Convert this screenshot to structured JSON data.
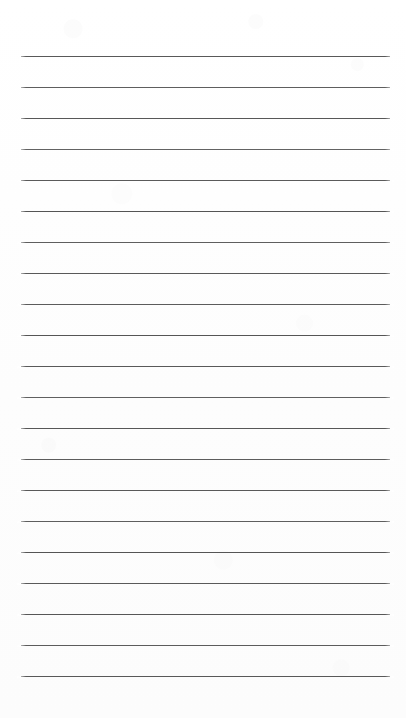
{
  "document": {
    "kind": "scanned-lined-notepad-page",
    "page_width": 406,
    "page_height": 718,
    "paper_color": "#fdfdfd",
    "text_content": "",
    "has_handwriting": false,
    "has_margin_rule": false,
    "has_page_border": false
  },
  "ruling": {
    "line_color": "#4d4d4d",
    "line_thickness_px": 1.2,
    "line_count": 21,
    "line_left_x": 21,
    "line_right_x": 390,
    "line_length_px": 369,
    "line_spacing_px": 31,
    "first_line_y": 56,
    "last_line_y": 676,
    "top_margin_px": 56,
    "bottom_margin_px": 42,
    "lines": [
      {
        "index": 1,
        "y": 56,
        "opacity": 0.93
      },
      {
        "index": 2,
        "y": 87,
        "opacity": 0.9
      },
      {
        "index": 3,
        "y": 118,
        "opacity": 0.94
      },
      {
        "index": 4,
        "y": 149,
        "opacity": 0.88
      },
      {
        "index": 5,
        "y": 180,
        "opacity": 0.92
      },
      {
        "index": 6,
        "y": 211,
        "opacity": 0.95
      },
      {
        "index": 7,
        "y": 242,
        "opacity": 0.9
      },
      {
        "index": 8,
        "y": 273,
        "opacity": 0.93
      },
      {
        "index": 9,
        "y": 304,
        "opacity": 0.91
      },
      {
        "index": 10,
        "y": 335,
        "opacity": 0.95
      },
      {
        "index": 11,
        "y": 366,
        "opacity": 0.92
      },
      {
        "index": 12,
        "y": 397,
        "opacity": 0.89
      },
      {
        "index": 13,
        "y": 428,
        "opacity": 0.94
      },
      {
        "index": 14,
        "y": 459,
        "opacity": 0.91
      },
      {
        "index": 15,
        "y": 490,
        "opacity": 0.93
      },
      {
        "index": 16,
        "y": 521,
        "opacity": 0.9
      },
      {
        "index": 17,
        "y": 552,
        "opacity": 0.95
      },
      {
        "index": 18,
        "y": 583,
        "opacity": 0.92
      },
      {
        "index": 19,
        "y": 614,
        "opacity": 0.94
      },
      {
        "index": 20,
        "y": 645,
        "opacity": 0.91
      },
      {
        "index": 21,
        "y": 676,
        "opacity": 0.93
      }
    ]
  }
}
